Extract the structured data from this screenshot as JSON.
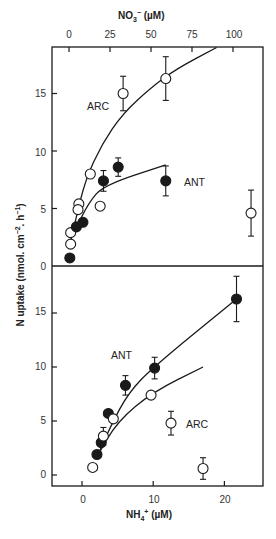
{
  "chart_data": [
    {
      "type": "scatter",
      "panel": "top",
      "title": "",
      "xlabel": "NO3- (µM)",
      "ylabel": "N uptake (nmol. cm-2. h-1)",
      "xlim": [
        -10,
        118
      ],
      "ylim": [
        0,
        19
      ],
      "x_ticks": [
        0,
        25,
        50,
        75,
        100
      ],
      "y_ticks": [
        0,
        5,
        10,
        15
      ],
      "grid": false,
      "series": [
        {
          "name": "ARC",
          "marker": "open-circle",
          "points": [
            {
              "x": 1,
              "y": 1.9
            },
            {
              "x": 1,
              "y": 2.9
            },
            {
              "x": 6,
              "y": 5.4
            },
            {
              "x": 5.5,
              "y": 4.9
            },
            {
              "x": 13,
              "y": 8.0
            },
            {
              "x": 19,
              "y": 5.2
            },
            {
              "x": 33,
              "y": 15.0,
              "err": 1.5
            },
            {
              "x": 59,
              "y": 16.3,
              "err": 1.9
            },
            {
              "x": 111,
              "y": 4.6,
              "err": 2.0
            }
          ],
          "fit_curve": [
            [
              0,
              1.5
            ],
            [
              4,
              4
            ],
            [
              10,
              7.5
            ],
            [
              20,
              10.6
            ],
            [
              33,
              13.3
            ],
            [
              50,
              15.5
            ],
            [
              65,
              17.1
            ],
            [
              90,
              19
            ]
          ]
        },
        {
          "name": "ANT",
          "marker": "filled-circle",
          "points": [
            {
              "x": 0.5,
              "y": 0.7
            },
            {
              "x": 4.5,
              "y": 3.4
            },
            {
              "x": 8.5,
              "y": 3.8
            },
            {
              "x": 21,
              "y": 7.4,
              "err": 0.9
            },
            {
              "x": 30,
              "y": 8.6,
              "err": 0.8
            },
            {
              "x": 59,
              "y": 7.4,
              "err": 1.3
            }
          ],
          "fit_curve": [
            [
              4,
              3.2
            ],
            [
              12,
              5.5
            ],
            [
              21,
              7.0
            ],
            [
              59,
              8.8
            ]
          ]
        }
      ],
      "annotations": [
        {
          "text": "ARC",
          "x": 20,
          "y": 14.3
        },
        {
          "text": "ANT",
          "x": 77,
          "y": 7.4
        }
      ]
    },
    {
      "type": "scatter",
      "panel": "bottom",
      "title": "",
      "xlabel": "NH4+ (µM)",
      "ylabel": "N uptake (nmol. cm-2. h-1)",
      "xlim": [
        -4.2,
        25
      ],
      "ylim": [
        -1,
        19.5
      ],
      "x_ticks": [
        0,
        10,
        20
      ],
      "y_ticks": [
        0,
        5,
        10,
        15
      ],
      "grid": false,
      "series": [
        {
          "name": "ANT",
          "marker": "filled-circle",
          "points": [
            {
              "x": 2.1,
              "y": 1.9
            },
            {
              "x": 2.7,
              "y": 3.0
            },
            {
              "x": 3.7,
              "y": 5.7
            },
            {
              "x": 6.1,
              "y": 8.3,
              "err": 0.9
            },
            {
              "x": 10.2,
              "y": 9.9,
              "err": 1.0
            },
            {
              "x": 21.7,
              "y": 16.3,
              "err": 2.1
            }
          ],
          "fit_curve": [
            [
              2,
              1.5
            ],
            [
              4,
              4.5
            ],
            [
              6.5,
              7.6
            ],
            [
              10,
              10.0
            ],
            [
              21.7,
              16.3
            ]
          ]
        },
        {
          "name": "ARC",
          "marker": "open-circle",
          "points": [
            {
              "x": 1.5,
              "y": 0.7
            },
            {
              "x": 3.0,
              "y": 3.6,
              "err": 0.8
            },
            {
              "x": 4.4,
              "y": 5.2
            },
            {
              "x": 9.7,
              "y": 7.4
            },
            {
              "x": 12.5,
              "y": 4.8,
              "err": 1.1
            },
            {
              "x": 17.0,
              "y": 0.6,
              "err": 1.0
            }
          ],
          "fit_curve": [
            [
              2,
              1.6
            ],
            [
              5,
              5.0
            ],
            [
              10,
              7.7
            ],
            [
              17,
              10
            ]
          ]
        }
      ],
      "annotations": [
        {
          "text": "ANT",
          "x": 5.5,
          "y": 11.2
        },
        {
          "text": "ARC",
          "x": 15.8,
          "y": 4.7
        }
      ]
    }
  ],
  "labels": {
    "top_axis_title_main": "NO",
    "top_axis_title_sub": "3",
    "top_axis_title_sup": "−",
    "top_axis_title_unit": " (µM)",
    "bottom_axis_title_main": "NH",
    "bottom_axis_title_sub": "4",
    "bottom_axis_title_sup": "+",
    "bottom_axis_title_unit": " (µM)",
    "ylabel_main": "N uptake (nmol. cm",
    "ylabel_sup1": "−2",
    "ylabel_mid": ". h",
    "ylabel_sup2": "−1",
    "ylabel_end": ")",
    "top_x_ticks": [
      "0",
      "25",
      "50",
      "75",
      "100"
    ],
    "bottom_x_ticks": [
      "0",
      "10",
      "20"
    ],
    "top_y_ticks": [
      "15",
      "10",
      "5",
      "0"
    ],
    "bottom_y_ticks": [
      "15",
      "10",
      "5",
      "0"
    ],
    "top_arc_label": "ARC",
    "top_ant_label": "ANT",
    "bottom_ant_label": "ANT",
    "bottom_arc_label": "ARC"
  },
  "colors": {
    "ink": "#1a1a1a",
    "background": "#ffffff"
  }
}
